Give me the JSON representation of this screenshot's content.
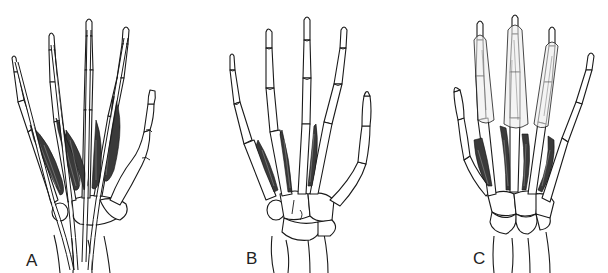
{
  "figure": {
    "panels": [
      {
        "id": "A",
        "label": "A",
        "content": "Hand skeleton with lumbrical muscles and flexor tendons"
      },
      {
        "id": "B",
        "label": "B",
        "content": "Hand skeleton with palmar interossei muscles"
      },
      {
        "id": "C",
        "label": "C",
        "content": "Hand skeleton with dorsal interossei muscles and extensor expansions"
      }
    ]
  },
  "colors": {
    "background": "#ffffff",
    "line": "#1a1a1a",
    "muscle_fill": "#3a3a3a"
  }
}
